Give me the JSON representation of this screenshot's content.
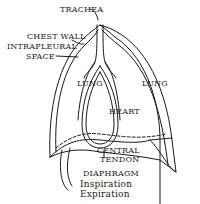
{
  "figure": {
    "labels": {
      "trachea": "TRACHEA",
      "chest_wall": "CHEST WALL",
      "intrapleural_1": "INTRAPLEURAL",
      "intrapleural_2": "SPACE",
      "lung_left": "LUNG",
      "lung_right": "LUNG",
      "heart": "HEART",
      "central_1": "CENTRAL",
      "central_2": "TENDON",
      "diaphragm": "DIAPHRAGM",
      "inspiration": "Inspiration",
      "expiration": "Expiration"
    },
    "colors": {
      "ink": "#1a1a1a",
      "background": "#ffffff"
    }
  }
}
